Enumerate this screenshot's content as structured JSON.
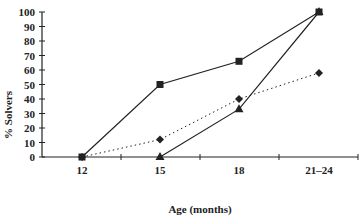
{
  "chart_data": {
    "type": "line",
    "title": "",
    "xlabel": "Age (months)",
    "ylabel": "% Solvers",
    "categories": [
      "12",
      "15",
      "18",
      "21–24"
    ],
    "ylim": [
      0,
      100
    ],
    "yticks": [
      0,
      10,
      20,
      30,
      40,
      50,
      60,
      70,
      80,
      90,
      100
    ],
    "grid": false,
    "legend": "none",
    "series": [
      {
        "name": "square-series",
        "marker": "square",
        "line": "solid",
        "values": [
          0,
          50,
          66,
          100
        ]
      },
      {
        "name": "triangle-series",
        "marker": "triangle",
        "line": "solid",
        "values": [
          null,
          0,
          33,
          100
        ]
      },
      {
        "name": "diamond-series",
        "marker": "diamond",
        "line": "dotted",
        "values": [
          0,
          12,
          40,
          58
        ]
      }
    ]
  },
  "colors": {
    "ink": "#222222",
    "background": "#ffffff"
  }
}
